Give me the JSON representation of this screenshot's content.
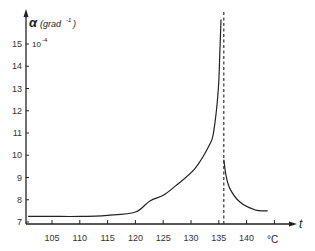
{
  "chart_data": {
    "type": "line",
    "title": "",
    "ylabel": "α (grad⁻¹)",
    "ylabel_symbol": "α",
    "ylabel_unit": "(grad⁻¹)",
    "y_scale_note": "10⁻⁴",
    "xlabel": "t",
    "x_unit": "°C",
    "xlim": [
      100.5,
      147
    ],
    "ylim": [
      7,
      16.3
    ],
    "x_ticks": [
      105,
      110,
      115,
      120,
      125,
      130,
      135,
      140
    ],
    "y_ticks": [
      7,
      8,
      9,
      10,
      11,
      12,
      13,
      14,
      15
    ],
    "grid": false,
    "legend": null,
    "critical_line": {
      "x": 135.9,
      "style": "dashed"
    },
    "series": [
      {
        "name": "below transition",
        "x": [
          100.7,
          105,
          110,
          115,
          120,
          122.6,
          125,
          127.1,
          130.7,
          133.4,
          134.1,
          134.9,
          135.2,
          135.4
        ],
        "y": [
          7.25,
          7.25,
          7.25,
          7.3,
          7.45,
          7.95,
          8.2,
          8.6,
          9.4,
          10.5,
          11.1,
          12.9,
          14.7,
          16.1
        ]
      },
      {
        "name": "above transition",
        "x": [
          135.9,
          136.3,
          137.0,
          138.8,
          141.5,
          143.8
        ],
        "y": [
          9.8,
          9.1,
          8.5,
          7.9,
          7.55,
          7.5
        ]
      }
    ]
  },
  "labels": {
    "y_symbol": "α",
    "y_unit": "(grad",
    "y_unit_exp": "-1",
    "y_unit_close": ")",
    "y_scale": "10",
    "y_scale_exp": "-4",
    "x_symbol": "t",
    "x_unit": "°C"
  }
}
